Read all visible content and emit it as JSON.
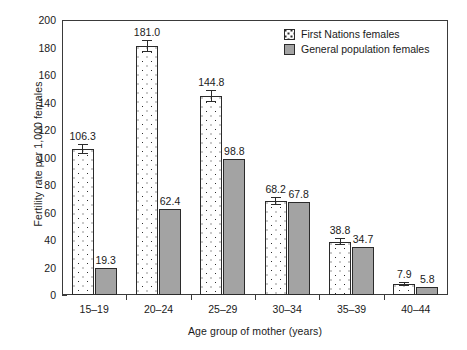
{
  "chart_data": {
    "type": "bar",
    "title": "",
    "xlabel": "Age group of mother (years)",
    "ylabel": "Fertility rate per 1,000 females",
    "ylim": [
      0,
      200
    ],
    "ytick_step": 20,
    "yticks": [
      "200",
      "180",
      "160",
      "140",
      "120",
      "100",
      "80",
      "60",
      "40",
      "20",
      "0"
    ],
    "grid": false,
    "legend_position": "top-right",
    "categories": [
      "15–19",
      "20–24",
      "25–29",
      "30–34",
      "35–39",
      "40–44"
    ],
    "series": [
      {
        "name": "First Nations females",
        "key": "fn",
        "fill": "white-with-black-dots",
        "values": [
          106.3,
          181.0,
          144.8,
          68.2,
          38.8,
          7.9
        ],
        "labels": [
          "106.3",
          "181.0",
          "144.8",
          "68.2",
          "38.8",
          "7.9"
        ],
        "errors": [
          3.4,
          4.6,
          4.3,
          3.0,
          2.3,
          1.3
        ]
      },
      {
        "name": "General population females",
        "key": "gp",
        "fill": "#a3a3a3",
        "values": [
          19.3,
          62.4,
          98.8,
          67.8,
          34.7,
          5.8
        ],
        "labels": [
          "19.3",
          "62.4",
          "98.8",
          "67.8",
          "34.7",
          "5.8"
        ],
        "errors": [
          0,
          0,
          0,
          0,
          0,
          0
        ]
      }
    ]
  },
  "legend": {
    "items": [
      {
        "label": "First Nations females",
        "swatch": "dotted-white-swatch"
      },
      {
        "label": "General population females",
        "swatch": "gray-swatch"
      }
    ]
  },
  "colors": {
    "general_population_fill": "#a3a3a3",
    "first_nations_fill": "#ffffff",
    "line": "#2b2b2b",
    "text": "#1a1a1a"
  }
}
